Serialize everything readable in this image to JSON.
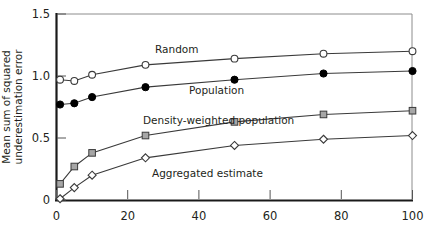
{
  "chart_data": {
    "type": "line",
    "title": "",
    "subtitle": "",
    "xlabel": "",
    "ylabel": "Mean sum of squared underestimation error",
    "ylabel_line1": "Mean sum of squared",
    "ylabel_line2": "underestimation error",
    "xlim": [
      0,
      100
    ],
    "ylim": [
      0,
      1.5
    ],
    "grid": false,
    "legend_position": "inline-annotations",
    "x_ticks": [
      0,
      20,
      40,
      60,
      80,
      100
    ],
    "x_tick_labels": [
      "0",
      "20",
      "40",
      "60",
      "80",
      "100"
    ],
    "y_ticks": [
      0,
      0.5,
      1.0,
      1.5
    ],
    "y_tick_labels": [
      "0",
      "0.5",
      "1.0",
      "1.5"
    ],
    "x": [
      1,
      5,
      10,
      25,
      50,
      75,
      100
    ],
    "series": [
      {
        "name": "Random",
        "marker": "open-circle",
        "values": [
          0.97,
          0.96,
          1.01,
          1.09,
          1.14,
          1.18,
          1.2
        ],
        "annotation": "Random",
        "annotation_x": 44,
        "annotation_y": 1.2
      },
      {
        "name": "Population",
        "marker": "filled-circle",
        "values": [
          0.77,
          0.78,
          0.83,
          0.91,
          0.97,
          1.02,
          1.04
        ],
        "annotation": "Population",
        "annotation_x": 52,
        "annotation_y": 0.9
      },
      {
        "name": "Density-weighted population",
        "marker": "gray-square",
        "values": [
          0.13,
          0.27,
          0.38,
          0.52,
          0.63,
          0.69,
          0.72
        ],
        "annotation": "Density-weighted population",
        "annotation_x": 36,
        "annotation_y": 0.66
      },
      {
        "name": "Aggregated estimate",
        "marker": "open-diamond",
        "values": [
          0.01,
          0.1,
          0.2,
          0.34,
          0.44,
          0.49,
          0.52
        ],
        "annotation": "Aggregated estimate",
        "annotation_x": 32,
        "annotation_y": 0.3
      }
    ]
  },
  "colors": {
    "axis": "#1a1a1a",
    "frame": "#8c8c8c",
    "line": "#3a3a3a",
    "text": "#231f20",
    "marker_fill_open": "#ffffff",
    "marker_fill_solid": "#000000",
    "marker_fill_gray": "#a6a6a6",
    "background": "#ffffff"
  }
}
